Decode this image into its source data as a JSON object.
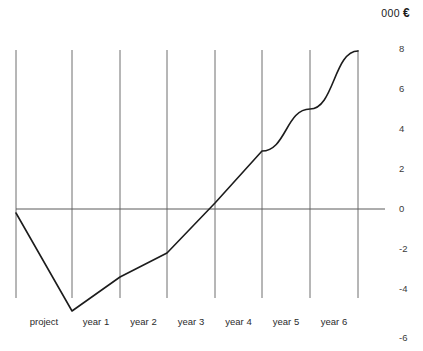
{
  "header": {
    "unit_prefix": "000",
    "currency_symbol": "€"
  },
  "axis": {
    "y_ticks": [
      "8",
      "6",
      "4",
      "2",
      "0",
      "-2",
      "-4",
      "-6"
    ],
    "x_ticks": [
      "project",
      "year 1",
      "year 2",
      "year 3",
      "year 4",
      "year 5",
      "year 6"
    ]
  },
  "colors": {
    "line": "#1c1c1c",
    "grid": "#6f6f6f",
    "zero_axis": "#5a5a5a",
    "text": "#2b2b2b",
    "background": "#ffffff"
  },
  "chart_data": {
    "type": "line",
    "title": "",
    "subtitle": "",
    "xlabel": "",
    "ylabel": "000 €",
    "categories": [
      "project",
      "year 1",
      "year 2",
      "year 3",
      "year 4",
      "year 5",
      "year 6",
      "year 7"
    ],
    "x": [
      0,
      1,
      2,
      3,
      4,
      5,
      6,
      7
    ],
    "values": [
      -0.2,
      -5.1,
      -3.4,
      -2.2,
      0.3,
      2.9,
      5.0,
      7.9
    ],
    "series": [
      {
        "name": "cumulative cash flow",
        "values": [
          -0.2,
          -5.1,
          -3.4,
          -2.2,
          0.3,
          2.9,
          5.0,
          7.9
        ]
      }
    ],
    "ylim": [
      -6,
      8
    ],
    "yticks": [
      8,
      6,
      4,
      2,
      0,
      -2,
      -4,
      -6
    ],
    "grid": "vertical",
    "legend": "none",
    "zero_line": true,
    "annotations": []
  }
}
